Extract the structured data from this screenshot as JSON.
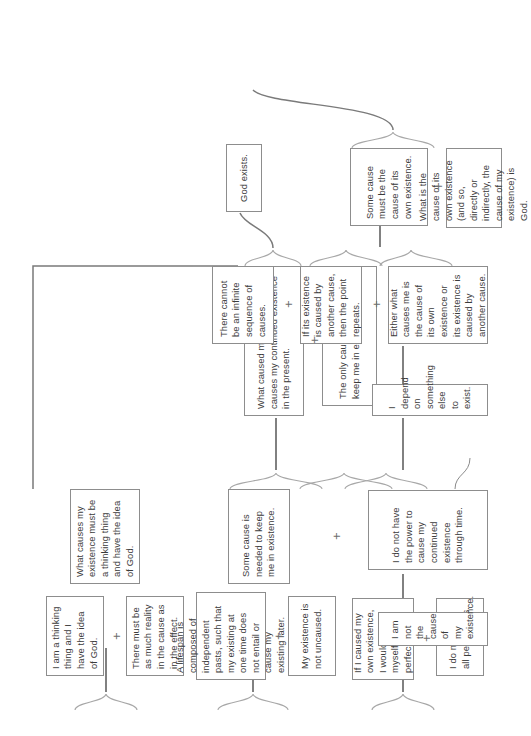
{
  "diagram": {
    "orientation": "rotated-90-ccw",
    "colors": {
      "box_border": "#8d8d8d",
      "text": "#3b3b3b",
      "connector": "#6b6b6b",
      "brace": "#a8a8a8",
      "background": "#ffffff"
    },
    "conjunction_symbol": "+"
  },
  "nodes": {
    "n_thinking_thing": "I am a thinking thing and I have the idea of God.",
    "n_reality_cause": "There must be as much reality in the cause as in the effect.",
    "n_cause_thinking": "What causes my existence must be a thinking thing and have the idea of God.",
    "n_lifespan": "A lifespan is composed of independent pasts, such that my existing at one time does not entail or cause my existing later.",
    "n_not_uncaused": "My existence is not uncaused.",
    "n_some_cause_keep": "Some cause is needed to keep me in existence.",
    "n_what_caused_present": "What caused my existence also causes my continued existence in the present.",
    "n_only_cause_keep": "The only cause that could keep me in existence is God.",
    "n_if_caused_give": "If I caused my own existence, I would give myself all perfections.",
    "n_not_all_perfections": "I do not have all perfections.",
    "n_not_cause_of_existence": "I am not the cause of my existence.",
    "n_no_power": "I do not have the power to cause my continued existence through time.",
    "n_depend": "I depend on something else to exist.",
    "n_either_what_causes": "Either what causes me is the cause of its own existence or its existence is caused by another cause.",
    "n_if_caused_repeats": "If its existence is caused by another cause, then the point repeats.",
    "n_no_infinite": "There cannot be an infinite sequence of causes.",
    "n_some_cause_own": "Some cause must be the cause of its own existence.",
    "n_what_is_cause": "What is the cause of its own existence (and so, directly or indirectly, the cause of my existence) is God.",
    "n_god_exists": "God exists."
  },
  "conjunctions": {
    "c1": "+",
    "c2": "+",
    "c3": "+",
    "c4": "+",
    "c5": "+",
    "c6": "+",
    "c7": "+",
    "c8": "+"
  }
}
